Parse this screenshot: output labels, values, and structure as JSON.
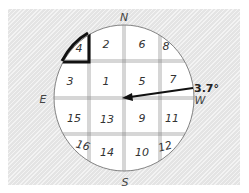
{
  "diagram": {
    "type": "compass-grid",
    "directions": {
      "north": "N",
      "south": "S",
      "east": "E",
      "west": "W"
    },
    "angle_label": "3.7°",
    "highlighted_cell": "4",
    "cells": [
      {
        "id": "4",
        "label": "4",
        "row": 0,
        "col": 0
      },
      {
        "id": "2",
        "label": "2",
        "row": 0,
        "col": 1
      },
      {
        "id": "6",
        "label": "6",
        "row": 0,
        "col": 2
      },
      {
        "id": "8",
        "label": "8",
        "row": 0,
        "col": 3
      },
      {
        "id": "3",
        "label": "3",
        "row": 1,
        "col": 0
      },
      {
        "id": "1",
        "label": "1",
        "row": 1,
        "col": 1
      },
      {
        "id": "5",
        "label": "5",
        "row": 1,
        "col": 2
      },
      {
        "id": "7",
        "label": "7",
        "row": 1,
        "col": 3
      },
      {
        "id": "15",
        "label": "15",
        "row": 2,
        "col": 0
      },
      {
        "id": "13",
        "label": "13",
        "row": 2,
        "col": 1
      },
      {
        "id": "9",
        "label": "9",
        "row": 2,
        "col": 2
      },
      {
        "id": "11",
        "label": "11",
        "row": 2,
        "col": 3
      },
      {
        "id": "16",
        "label": "16",
        "row": 3,
        "col": 0
      },
      {
        "id": "14",
        "label": "14",
        "row": 3,
        "col": 1
      },
      {
        "id": "10",
        "label": "10",
        "row": 3,
        "col": 2
      },
      {
        "id": "12",
        "label": "12",
        "row": 3,
        "col": 3
      }
    ],
    "colors": {
      "background": "#e4e4e4",
      "circle_fill": "#ffffff",
      "line": "#555555",
      "arrow": "#111111"
    }
  }
}
